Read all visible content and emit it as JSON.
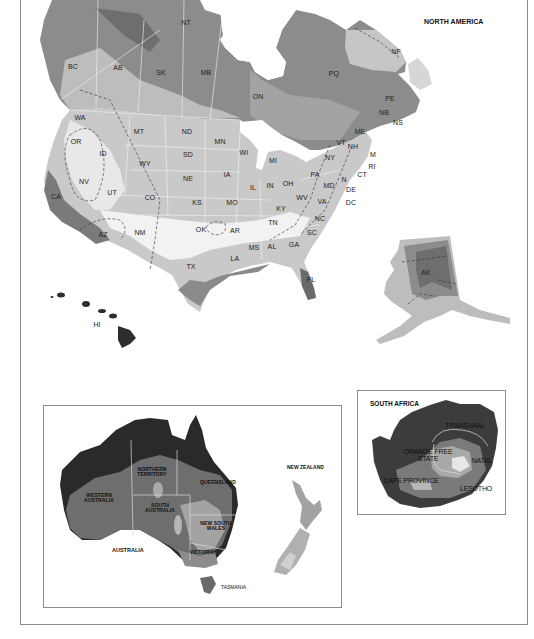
{
  "titles": {
    "north_america": "NORTH AMERICA",
    "south_africa": "SOUTH AFRICA",
    "australia": "AUSTRALIA",
    "new_zealand": "NEW ZEALAND",
    "tasmania": "TASMANIA"
  },
  "colors": {
    "water": "#ffffff",
    "zone_darkest": "#2a2a2a",
    "zone_dark": "#6a6a6a",
    "zone_mid_dark": "#8c8c8c",
    "zone_mid": "#a9a9a9",
    "zone_light": "#c9c9c9",
    "zone_lighter": "#dedede",
    "zone_lightest": "#f0f0f0",
    "border": "#f4f4f4",
    "frame": "#8a8a8a"
  },
  "north_america": {
    "labels": [
      {
        "text": "NT",
        "x": 186,
        "y": 22
      },
      {
        "text": "BC",
        "x": 73,
        "y": 66
      },
      {
        "text": "AB",
        "x": 118,
        "y": 67
      },
      {
        "text": "SK",
        "x": 161,
        "y": 72
      },
      {
        "text": "MB",
        "x": 206,
        "y": 72
      },
      {
        "text": "ON",
        "x": 258,
        "y": 96
      },
      {
        "text": "PQ",
        "x": 334,
        "y": 73
      },
      {
        "text": "NF",
        "x": 396,
        "y": 51
      },
      {
        "text": "PE",
        "x": 390,
        "y": 98
      },
      {
        "text": "NB",
        "x": 384,
        "y": 112
      },
      {
        "text": "NS",
        "x": 398,
        "y": 122
      },
      {
        "text": "WA",
        "x": 80,
        "y": 117
      },
      {
        "text": "MT",
        "x": 139,
        "y": 131
      },
      {
        "text": "ND",
        "x": 187,
        "y": 131
      },
      {
        "text": "MN",
        "x": 220,
        "y": 141
      },
      {
        "text": "ME",
        "x": 360,
        "y": 131
      },
      {
        "text": "OR",
        "x": 76,
        "y": 141
      },
      {
        "text": "ID",
        "x": 103,
        "y": 153
      },
      {
        "text": "SD",
        "x": 188,
        "y": 154
      },
      {
        "text": "WI",
        "x": 244,
        "y": 152
      },
      {
        "text": "VT",
        "x": 341,
        "y": 142
      },
      {
        "text": "NH",
        "x": 353,
        "y": 146
      },
      {
        "text": "M",
        "x": 373,
        "y": 154
      },
      {
        "text": "WY",
        "x": 145,
        "y": 163
      },
      {
        "text": "MI",
        "x": 273,
        "y": 160
      },
      {
        "text": "NY",
        "x": 330,
        "y": 157
      },
      {
        "text": "RI",
        "x": 372,
        "y": 166
      },
      {
        "text": "NE",
        "x": 188,
        "y": 178
      },
      {
        "text": "IA",
        "x": 227,
        "y": 174
      },
      {
        "text": "CT",
        "x": 362,
        "y": 174
      },
      {
        "text": "PA",
        "x": 315,
        "y": 174
      },
      {
        "text": "N",
        "x": 344,
        "y": 179
      },
      {
        "text": "NV",
        "x": 84,
        "y": 181
      },
      {
        "text": "IL",
        "x": 253,
        "y": 187
      },
      {
        "text": "IN",
        "x": 270,
        "y": 185
      },
      {
        "text": "OH",
        "x": 288,
        "y": 183
      },
      {
        "text": "MD",
        "x": 329,
        "y": 185
      },
      {
        "text": "DE",
        "x": 351,
        "y": 189
      },
      {
        "text": "UT",
        "x": 112,
        "y": 192
      },
      {
        "text": "CO",
        "x": 150,
        "y": 197
      },
      {
        "text": "WV",
        "x": 302,
        "y": 197
      },
      {
        "text": "VA",
        "x": 322,
        "y": 201
      },
      {
        "text": "DC",
        "x": 351,
        "y": 202
      },
      {
        "text": "KS",
        "x": 197,
        "y": 202
      },
      {
        "text": "MO",
        "x": 232,
        "y": 202
      },
      {
        "text": "KY",
        "x": 281,
        "y": 208
      },
      {
        "text": "CA",
        "x": 56,
        "y": 196
      },
      {
        "text": "NC",
        "x": 320,
        "y": 218
      },
      {
        "text": "TN",
        "x": 273,
        "y": 222
      },
      {
        "text": "AZ",
        "x": 103,
        "y": 234
      },
      {
        "text": "NM",
        "x": 140,
        "y": 232
      },
      {
        "text": "OK",
        "x": 201,
        "y": 229
      },
      {
        "text": "AR",
        "x": 235,
        "y": 230
      },
      {
        "text": "SC",
        "x": 312,
        "y": 232
      },
      {
        "text": "MS",
        "x": 254,
        "y": 247
      },
      {
        "text": "AL",
        "x": 272,
        "y": 246
      },
      {
        "text": "GA",
        "x": 294,
        "y": 244
      },
      {
        "text": "LA",
        "x": 235,
        "y": 258
      },
      {
        "text": "TX",
        "x": 191,
        "y": 266
      },
      {
        "text": "FL",
        "x": 311,
        "y": 279
      },
      {
        "text": "AK",
        "x": 426,
        "y": 272
      },
      {
        "text": "HI",
        "x": 97,
        "y": 324
      }
    ]
  },
  "australia": {
    "labels": [
      {
        "text": "NORTHERN\nTERRITORY",
        "x": 152,
        "y": 472
      },
      {
        "text": "QUEENSLAND",
        "x": 218,
        "y": 482
      },
      {
        "text": "WESTERN\nAUSTRALIA",
        "x": 99,
        "y": 498
      },
      {
        "text": "SOUTH\nAUSTRALIA",
        "x": 160,
        "y": 508
      },
      {
        "text": "NEW SOUTH\nWALES",
        "x": 216,
        "y": 526
      },
      {
        "text": "VICTORIA",
        "x": 202,
        "y": 552
      }
    ]
  },
  "south_africa": {
    "labels": [
      {
        "text": "TRANSVAAL",
        "x": 465,
        "y": 425
      },
      {
        "text": "ORANGE FREE\nSTATE",
        "x": 428,
        "y": 455
      },
      {
        "text": "NATAL",
        "x": 482,
        "y": 460
      },
      {
        "text": "CAPE PROVINCE",
        "x": 411,
        "y": 480
      },
      {
        "text": "LESOTHO",
        "x": 476,
        "y": 488
      }
    ]
  }
}
